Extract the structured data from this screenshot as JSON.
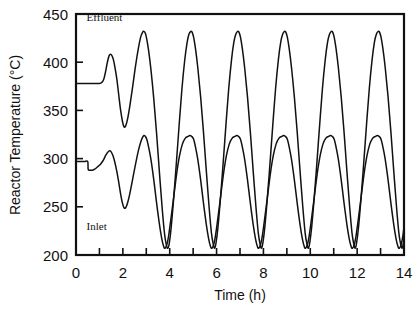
{
  "chart_data": {
    "type": "line",
    "title": "",
    "xlabel": "Time (h)",
    "ylabel": "Reactor Temperature (°C)",
    "xlim": [
      0,
      14
    ],
    "ylim": [
      200,
      450
    ],
    "xticks": [
      0,
      2,
      4,
      6,
      8,
      10,
      12,
      14
    ],
    "xtick_labels": [
      "0",
      "2",
      "4",
      "6",
      "8",
      "10",
      "12",
      "14"
    ],
    "xminor_ticks": [
      1,
      3,
      5,
      7,
      9,
      11,
      13
    ],
    "yticks": [
      200,
      250,
      300,
      350,
      400,
      450
    ],
    "ytick_labels": [
      "200",
      "250",
      "300",
      "350",
      "400",
      "450"
    ],
    "grid": false,
    "legend": "inline-annotations",
    "annotations": [
      {
        "text": "Effluent",
        "x": 0.45,
        "y": 443,
        "series": "effluent"
      },
      {
        "text": "Inlet",
        "x": 0.45,
        "y": 226,
        "series": "inlet"
      }
    ],
    "line_color": "#111111",
    "background_color": "#ffffff",
    "series": [
      {
        "name": "Effluent",
        "initial_value": 378,
        "steady_baseline": 378,
        "first_peak": {
          "x": 1.45,
          "y": 408
        },
        "first_trough": {
          "x": 2.05,
          "y": 333
        },
        "oscillation_period": 1.1,
        "oscillation_peak": 432,
        "oscillation_trough": 207,
        "onset_time": 1.2,
        "points": [
          [
            0.0,
            378
          ],
          [
            0.2,
            378
          ],
          [
            0.4,
            378
          ],
          [
            0.6,
            378
          ],
          [
            0.8,
            378
          ],
          [
            1.0,
            378
          ],
          [
            1.1,
            379
          ],
          [
            1.18,
            382
          ],
          [
            1.26,
            390
          ],
          [
            1.34,
            400
          ],
          [
            1.42,
            407
          ],
          [
            1.5,
            408
          ],
          [
            1.58,
            404
          ],
          [
            1.66,
            395
          ],
          [
            1.74,
            383
          ],
          [
            1.82,
            367
          ],
          [
            1.9,
            351
          ],
          [
            1.98,
            339
          ],
          [
            2.05,
            333
          ],
          [
            2.12,
            334
          ],
          [
            2.2,
            341
          ],
          [
            2.3,
            355
          ],
          [
            2.42,
            375
          ],
          [
            2.54,
            396
          ],
          [
            2.66,
            414
          ],
          [
            2.76,
            426
          ],
          [
            2.84,
            431
          ],
          [
            2.9,
            432
          ],
          [
            2.96,
            430
          ],
          [
            3.02,
            424
          ],
          [
            3.1,
            412
          ],
          [
            3.2,
            392
          ],
          [
            3.32,
            362
          ],
          [
            3.44,
            326
          ],
          [
            3.56,
            286
          ],
          [
            3.68,
            248
          ],
          [
            3.78,
            222
          ],
          [
            3.86,
            210
          ],
          [
            3.92,
            207
          ],
          [
            3.98,
            212
          ],
          [
            4.06,
            228
          ],
          [
            4.16,
            256
          ],
          [
            4.28,
            294
          ],
          [
            4.4,
            334
          ],
          [
            4.52,
            372
          ],
          [
            4.64,
            402
          ],
          [
            4.74,
            420
          ],
          [
            4.82,
            429
          ],
          [
            4.9,
            432
          ],
          [
            4.96,
            431
          ],
          [
            5.02,
            426
          ],
          [
            5.1,
            414
          ],
          [
            5.2,
            394
          ],
          [
            5.32,
            364
          ],
          [
            5.44,
            328
          ],
          [
            5.56,
            288
          ],
          [
            5.68,
            250
          ],
          [
            5.78,
            223
          ],
          [
            5.86,
            211
          ],
          [
            5.92,
            207
          ],
          [
            5.98,
            213
          ],
          [
            6.06,
            229
          ],
          [
            6.16,
            257
          ],
          [
            6.28,
            295
          ],
          [
            6.4,
            335
          ],
          [
            6.52,
            373
          ],
          [
            6.64,
            403
          ],
          [
            6.74,
            421
          ],
          [
            6.82,
            429
          ],
          [
            6.9,
            432
          ],
          [
            6.96,
            431
          ],
          [
            7.02,
            426
          ],
          [
            7.1,
            414
          ],
          [
            7.2,
            394
          ],
          [
            7.32,
            364
          ],
          [
            7.44,
            328
          ],
          [
            7.56,
            288
          ],
          [
            7.68,
            250
          ],
          [
            7.78,
            223
          ],
          [
            7.86,
            211
          ],
          [
            7.92,
            207
          ],
          [
            7.98,
            213
          ],
          [
            8.06,
            229
          ],
          [
            8.16,
            257
          ],
          [
            8.28,
            295
          ],
          [
            8.4,
            335
          ],
          [
            8.52,
            373
          ],
          [
            8.64,
            403
          ],
          [
            8.74,
            421
          ],
          [
            8.82,
            429
          ],
          [
            8.9,
            432
          ],
          [
            8.96,
            431
          ],
          [
            9.02,
            426
          ],
          [
            9.1,
            414
          ],
          [
            9.2,
            394
          ],
          [
            9.32,
            364
          ],
          [
            9.44,
            328
          ],
          [
            9.56,
            288
          ],
          [
            9.68,
            250
          ],
          [
            9.78,
            223
          ],
          [
            9.86,
            211
          ],
          [
            9.92,
            207
          ],
          [
            9.98,
            213
          ],
          [
            10.06,
            229
          ],
          [
            10.16,
            257
          ],
          [
            10.28,
            295
          ],
          [
            10.4,
            335
          ],
          [
            10.52,
            373
          ],
          [
            10.64,
            403
          ],
          [
            10.74,
            421
          ],
          [
            10.82,
            429
          ],
          [
            10.9,
            432
          ],
          [
            10.96,
            431
          ],
          [
            11.02,
            426
          ],
          [
            11.1,
            414
          ],
          [
            11.2,
            394
          ],
          [
            11.32,
            364
          ],
          [
            11.44,
            328
          ],
          [
            11.56,
            288
          ],
          [
            11.68,
            250
          ],
          [
            11.78,
            223
          ],
          [
            11.86,
            211
          ],
          [
            11.92,
            207
          ],
          [
            11.98,
            213
          ],
          [
            12.06,
            229
          ],
          [
            12.16,
            257
          ],
          [
            12.28,
            295
          ],
          [
            12.4,
            335
          ],
          [
            12.52,
            373
          ],
          [
            12.64,
            403
          ],
          [
            12.74,
            421
          ],
          [
            12.82,
            429
          ],
          [
            12.9,
            432
          ],
          [
            12.96,
            431
          ],
          [
            13.02,
            426
          ],
          [
            13.1,
            414
          ],
          [
            13.2,
            394
          ],
          [
            13.32,
            364
          ],
          [
            13.44,
            328
          ],
          [
            13.56,
            288
          ],
          [
            13.68,
            250
          ],
          [
            13.78,
            223
          ],
          [
            13.86,
            211
          ],
          [
            13.92,
            207
          ],
          [
            13.98,
            213
          ],
          [
            14.0,
            217
          ]
        ]
      },
      {
        "name": "Inlet",
        "initial_value": 297,
        "steady_baseline": 288,
        "first_peak": {
          "x": 1.45,
          "y": 308
        },
        "first_trough": {
          "x": 2.05,
          "y": 249
        },
        "oscillation_period": 1.1,
        "oscillation_peak": 324,
        "oscillation_trough": 207,
        "onset_time": 1.2,
        "points": [
          [
            0.0,
            297
          ],
          [
            0.18,
            297
          ],
          [
            0.36,
            297
          ],
          [
            0.5,
            297
          ],
          [
            0.52,
            289
          ],
          [
            0.6,
            288
          ],
          [
            0.7,
            288
          ],
          [
            0.8,
            289
          ],
          [
            0.9,
            291
          ],
          [
            1.0,
            293
          ],
          [
            1.1,
            296
          ],
          [
            1.18,
            299
          ],
          [
            1.26,
            303
          ],
          [
            1.34,
            306
          ],
          [
            1.42,
            308
          ],
          [
            1.5,
            307
          ],
          [
            1.58,
            303
          ],
          [
            1.66,
            296
          ],
          [
            1.74,
            287
          ],
          [
            1.82,
            276
          ],
          [
            1.9,
            264
          ],
          [
            1.98,
            254
          ],
          [
            2.05,
            249
          ],
          [
            2.12,
            249
          ],
          [
            2.2,
            254
          ],
          [
            2.3,
            264
          ],
          [
            2.42,
            279
          ],
          [
            2.54,
            294
          ],
          [
            2.66,
            308
          ],
          [
            2.76,
            317
          ],
          [
            2.84,
            322
          ],
          [
            2.9,
            324
          ],
          [
            2.96,
            323
          ],
          [
            3.02,
            320
          ],
          [
            3.1,
            312
          ],
          [
            3.2,
            299
          ],
          [
            3.32,
            278
          ],
          [
            3.44,
            254
          ],
          [
            3.56,
            232
          ],
          [
            3.66,
            217
          ],
          [
            3.74,
            209
          ],
          [
            3.8,
            207
          ],
          [
            3.88,
            211
          ],
          [
            3.96,
            221
          ],
          [
            4.06,
            239
          ],
          [
            4.18,
            262
          ],
          [
            4.3,
            285
          ],
          [
            4.42,
            303
          ],
          [
            4.54,
            315
          ],
          [
            4.66,
            321
          ],
          [
            4.78,
            323
          ],
          [
            4.86,
            324
          ],
          [
            4.94,
            323
          ],
          [
            5.02,
            320
          ],
          [
            5.1,
            312
          ],
          [
            5.2,
            299
          ],
          [
            5.32,
            278
          ],
          [
            5.44,
            254
          ],
          [
            5.56,
            232
          ],
          [
            5.66,
            217
          ],
          [
            5.74,
            209
          ],
          [
            5.8,
            207
          ],
          [
            5.88,
            211
          ],
          [
            5.96,
            221
          ],
          [
            6.06,
            239
          ],
          [
            6.18,
            262
          ],
          [
            6.3,
            285
          ],
          [
            6.42,
            303
          ],
          [
            6.54,
            315
          ],
          [
            6.66,
            321
          ],
          [
            6.78,
            323
          ],
          [
            6.86,
            324
          ],
          [
            6.94,
            323
          ],
          [
            7.02,
            320
          ],
          [
            7.1,
            312
          ],
          [
            7.2,
            299
          ],
          [
            7.32,
            278
          ],
          [
            7.44,
            254
          ],
          [
            7.56,
            232
          ],
          [
            7.66,
            217
          ],
          [
            7.74,
            209
          ],
          [
            7.8,
            207
          ],
          [
            7.88,
            211
          ],
          [
            7.96,
            221
          ],
          [
            8.06,
            239
          ],
          [
            8.18,
            262
          ],
          [
            8.3,
            285
          ],
          [
            8.42,
            303
          ],
          [
            8.54,
            315
          ],
          [
            8.66,
            321
          ],
          [
            8.78,
            323
          ],
          [
            8.86,
            324
          ],
          [
            8.94,
            323
          ],
          [
            9.02,
            320
          ],
          [
            9.1,
            312
          ],
          [
            9.2,
            299
          ],
          [
            9.32,
            278
          ],
          [
            9.44,
            254
          ],
          [
            9.56,
            232
          ],
          [
            9.66,
            217
          ],
          [
            9.74,
            209
          ],
          [
            9.8,
            207
          ],
          [
            9.88,
            211
          ],
          [
            9.96,
            221
          ],
          [
            10.06,
            239
          ],
          [
            10.18,
            262
          ],
          [
            10.3,
            285
          ],
          [
            10.42,
            303
          ],
          [
            10.54,
            315
          ],
          [
            10.66,
            321
          ],
          [
            10.78,
            323
          ],
          [
            10.86,
            324
          ],
          [
            10.94,
            323
          ],
          [
            11.02,
            320
          ],
          [
            11.1,
            312
          ],
          [
            11.2,
            299
          ],
          [
            11.32,
            278
          ],
          [
            11.44,
            254
          ],
          [
            11.56,
            232
          ],
          [
            11.66,
            217
          ],
          [
            11.74,
            209
          ],
          [
            11.8,
            207
          ],
          [
            11.88,
            211
          ],
          [
            11.96,
            221
          ],
          [
            12.06,
            239
          ],
          [
            12.18,
            262
          ],
          [
            12.3,
            285
          ],
          [
            12.42,
            303
          ],
          [
            12.54,
            315
          ],
          [
            12.66,
            321
          ],
          [
            12.78,
            323
          ],
          [
            12.86,
            324
          ],
          [
            12.94,
            323
          ],
          [
            13.02,
            320
          ],
          [
            13.1,
            312
          ],
          [
            13.2,
            299
          ],
          [
            13.32,
            278
          ],
          [
            13.44,
            254
          ],
          [
            13.56,
            232
          ],
          [
            13.66,
            217
          ],
          [
            13.74,
            209
          ],
          [
            13.8,
            207
          ],
          [
            13.88,
            211
          ],
          [
            13.96,
            221
          ],
          [
            14.0,
            230
          ]
        ]
      }
    ]
  }
}
